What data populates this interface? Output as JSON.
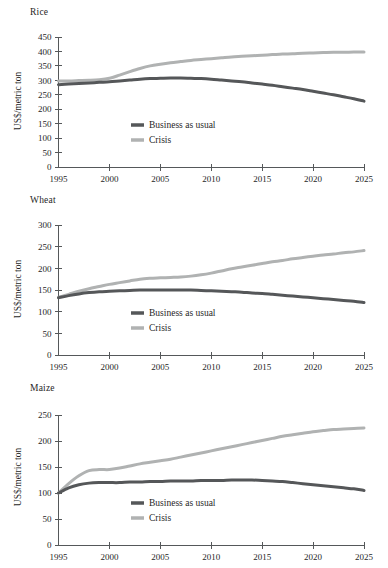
{
  "figure": {
    "y_axis_label": "US$/metric ton",
    "series_colors": {
      "business_as_usual": "#555759",
      "crisis": "#b0b2b2"
    },
    "legend_labels": {
      "business_as_usual": "Business as usual",
      "crisis": "Crisis"
    }
  },
  "chart_data": [
    {
      "type": "line",
      "title": "Rice",
      "xlabel": "",
      "ylabel": "US$/metric ton",
      "xlim": [
        1995,
        2025
      ],
      "ylim": [
        0,
        450
      ],
      "xticks": [
        "1995",
        "2000",
        "2005",
        "2010",
        "2015",
        "2020",
        "2025"
      ],
      "yticks": [
        "0",
        "50",
        "100",
        "150",
        "200",
        "250",
        "300",
        "350",
        "400",
        "450"
      ],
      "grid": false,
      "legend_position": "center",
      "x": [
        1995,
        1996,
        1997,
        1998,
        1999,
        2000,
        2001,
        2002,
        2003,
        2004,
        2005,
        2006,
        2007,
        2008,
        2009,
        2010,
        2011,
        2012,
        2013,
        2014,
        2015,
        2016,
        2017,
        2018,
        2019,
        2020,
        2021,
        2022,
        2023,
        2024,
        2025
      ],
      "series": [
        {
          "name": "Business as usual",
          "color": "#555759",
          "values": [
            285,
            287,
            289,
            291,
            293,
            295,
            298,
            301,
            304,
            306,
            307,
            308,
            308,
            307,
            306,
            304,
            301,
            298,
            295,
            291,
            287,
            283,
            278,
            273,
            268,
            262,
            256,
            250,
            243,
            236,
            228
          ]
        },
        {
          "name": "Crisis",
          "color": "#b0b2b2",
          "values": [
            298,
            298,
            299,
            300,
            302,
            307,
            318,
            330,
            341,
            350,
            356,
            361,
            365,
            369,
            372,
            375,
            378,
            381,
            383,
            385,
            387,
            389,
            391,
            392,
            394,
            395,
            396,
            397,
            397,
            398,
            398
          ]
        }
      ]
    },
    {
      "type": "line",
      "title": "Wheat",
      "xlabel": "",
      "ylabel": "US$/metric ton",
      "xlim": [
        1995,
        2025
      ],
      "ylim": [
        0,
        300
      ],
      "xticks": [
        "1995",
        "2000",
        "2005",
        "2010",
        "2015",
        "2020",
        "2025"
      ],
      "yticks": [
        "0",
        "50",
        "100",
        "150",
        "200",
        "250",
        "300"
      ],
      "grid": false,
      "legend_position": "center",
      "x": [
        1995,
        1996,
        1997,
        1998,
        1999,
        2000,
        2001,
        2002,
        2003,
        2004,
        2005,
        2006,
        2007,
        2008,
        2009,
        2010,
        2011,
        2012,
        2013,
        2014,
        2015,
        2016,
        2017,
        2018,
        2019,
        2020,
        2021,
        2022,
        2023,
        2024,
        2025
      ],
      "series": [
        {
          "name": "Business as usual",
          "color": "#555759",
          "values": [
            132,
            137,
            141,
            144,
            146,
            147,
            148,
            149,
            150,
            150,
            150,
            150,
            150,
            150,
            149,
            148,
            147,
            146,
            145,
            143,
            142,
            140,
            138,
            136,
            134,
            132,
            130,
            128,
            126,
            124,
            121
          ]
        },
        {
          "name": "Crisis",
          "color": "#b0b2b2",
          "values": [
            133,
            140,
            147,
            153,
            158,
            163,
            167,
            171,
            175,
            177,
            178,
            179,
            180,
            182,
            185,
            189,
            194,
            199,
            203,
            207,
            211,
            215,
            218,
            222,
            225,
            228,
            231,
            233,
            236,
            238,
            241
          ]
        }
      ]
    },
    {
      "type": "line",
      "title": "Maize",
      "xlabel": "",
      "ylabel": "US$/metric ton",
      "xlim": [
        1995,
        2025
      ],
      "ylim": [
        0,
        250
      ],
      "xticks": [
        "1995",
        "2000",
        "2005",
        "2010",
        "2015",
        "2020",
        "2025"
      ],
      "yticks": [
        "0",
        "50",
        "100",
        "150",
        "200",
        "250"
      ],
      "grid": false,
      "legend_position": "center",
      "x": [
        1995,
        1996,
        1997,
        1998,
        1999,
        2000,
        2001,
        2002,
        2003,
        2004,
        2005,
        2006,
        2007,
        2008,
        2009,
        2010,
        2011,
        2012,
        2013,
        2014,
        2015,
        2016,
        2017,
        2018,
        2019,
        2020,
        2021,
        2022,
        2023,
        2024,
        2025
      ],
      "series": [
        {
          "name": "Business as usual",
          "color": "#555759",
          "values": [
            100,
            110,
            116,
            119,
            120,
            120,
            120,
            121,
            121,
            122,
            122,
            123,
            123,
            123,
            124,
            124,
            124,
            125,
            125,
            125,
            124,
            123,
            122,
            120,
            118,
            116,
            114,
            112,
            110,
            108,
            105
          ]
        },
        {
          "name": "Crisis",
          "color": "#b0b2b2",
          "values": [
            100,
            118,
            133,
            143,
            145,
            145,
            148,
            152,
            156,
            159,
            162,
            165,
            169,
            173,
            177,
            181,
            185,
            189,
            193,
            197,
            201,
            205,
            209,
            212,
            215,
            218,
            220,
            222,
            223,
            224,
            225
          ]
        }
      ]
    }
  ]
}
